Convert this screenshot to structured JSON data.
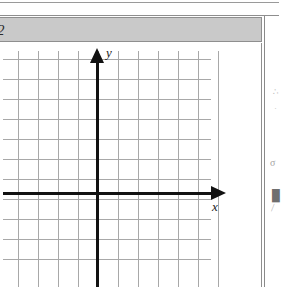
{
  "page": {
    "background_color": "#ffffff",
    "right_margin_border_color": "#8a8a8a"
  },
  "question_header": {
    "number_label": "2",
    "background_color": "#c9c9c9",
    "border_color": "#8f8f8f"
  },
  "graph": {
    "axis_label_x": "x",
    "axis_label_y": "y",
    "axis_color": "#121212",
    "gridline_color": "#a8a8a8"
  },
  "chart_data": {
    "type": "line",
    "title": "",
    "subtitle": "",
    "xlabel": "x",
    "ylabel": "y",
    "series": [],
    "x": [],
    "categories": [],
    "values": [],
    "xlim": [
      -5,
      6
    ],
    "ylim": [
      -5,
      7
    ],
    "xticks": [
      -5,
      -4,
      -3,
      -2,
      -1,
      0,
      1,
      2,
      3,
      4,
      5,
      6
    ],
    "yticks": [
      -5,
      -4,
      -3,
      -2,
      -1,
      0,
      1,
      2,
      3,
      4,
      5,
      6,
      7
    ],
    "xtick_labels": [],
    "ytick_labels": [],
    "grid": true,
    "grid_vertical_count": 11,
    "grid_horizontal_count": 11,
    "grid_spacing_px": 20,
    "legend": [],
    "legend_position": "none",
    "annotations": []
  },
  "scan_artifacts": {
    "marks": [
      "∴",
      "·",
      "σ",
      "█",
      "⁄"
    ]
  }
}
